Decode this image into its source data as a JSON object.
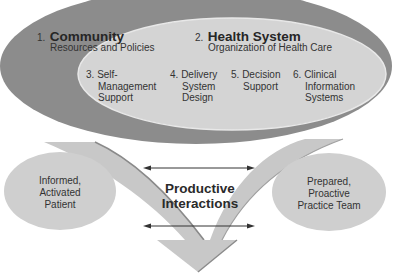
{
  "colors": {
    "outer_ellipse": "#8c8c8c",
    "inner_ellipse": "#d4d4d4",
    "inner_ellipse_stroke": "#e6e6e6",
    "arrow": "#c8c8c8",
    "arrow_shadow": "#8a8a8a",
    "side_ovals": "#cfcfcf",
    "line": "#333333"
  },
  "community": {
    "number": "1.",
    "title": "Community",
    "subtitle": "Resources and Policies"
  },
  "health_system": {
    "number": "2.",
    "title": "Health System",
    "subtitle": "Organization of Health Care"
  },
  "components": [
    {
      "number": "3.",
      "lines": [
        "Self-",
        "Management",
        "Support"
      ]
    },
    {
      "number": "4.",
      "lines": [
        "Delivery",
        "System",
        "Design"
      ]
    },
    {
      "number": "5.",
      "lines": [
        "Decision",
        "Support"
      ]
    },
    {
      "number": "6.",
      "lines": [
        "Clinical",
        "Information",
        "Systems"
      ]
    }
  ],
  "center": {
    "line1": "Productive",
    "line2": "Interactions"
  },
  "patient": {
    "lines": [
      "Informed,",
      "Activated",
      "Patient"
    ]
  },
  "team": {
    "lines": [
      "Prepared,",
      "Proactive",
      "Practice Team"
    ]
  }
}
